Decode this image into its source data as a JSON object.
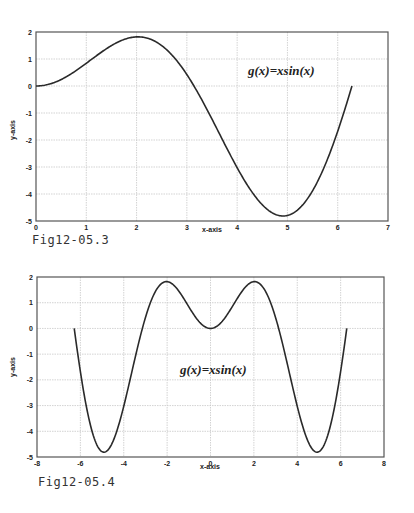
{
  "figures": [
    {
      "caption": "Fig12-05.3"
    },
    {
      "caption": "Fig12-05.4"
    }
  ],
  "chart_data": [
    {
      "type": "line",
      "title": "",
      "annotation": "g(x)=xsin(x)",
      "xlabel": "x-axis",
      "ylabel": "y-axis",
      "xlim": [
        0,
        7
      ],
      "ylim": [
        -5,
        2
      ],
      "xticks": [
        0,
        1,
        2,
        3,
        4,
        5,
        6,
        7
      ],
      "yticks": [
        -5,
        -4,
        -3,
        -2,
        -1,
        0,
        1,
        2
      ],
      "grid": true,
      "function": "x*sin(x)",
      "x_range": [
        0,
        6.2832
      ],
      "series": [
        {
          "name": "g(x)=xsin(x)",
          "x": [
            0,
            0.5,
            1,
            1.5,
            2,
            2.03,
            2.5,
            3,
            3.5,
            4,
            4.5,
            4.91,
            5,
            5.5,
            6,
            6.2832
          ],
          "y": [
            0,
            0.24,
            0.84,
            1.5,
            1.82,
            1.82,
            1.5,
            0.42,
            -1.23,
            -3.03,
            -4.4,
            -4.81,
            -4.79,
            -3.89,
            -1.68,
            0
          ]
        }
      ],
      "caption": "Fig12-05.3"
    },
    {
      "type": "line",
      "title": "",
      "annotation": "g(x)=xsin(x)",
      "xlabel": "x-axis",
      "ylabel": "y-axis",
      "xlim": [
        -8,
        8
      ],
      "ylim": [
        -5,
        2
      ],
      "xticks": [
        -8,
        -6,
        -4,
        -2,
        0,
        2,
        4,
        6,
        8
      ],
      "yticks": [
        -5,
        -4,
        -3,
        -2,
        -1,
        0,
        1,
        2
      ],
      "grid": true,
      "function": "x*sin(x)",
      "x_range": [
        -6.2832,
        6.2832
      ],
      "series": [
        {
          "name": "g(x)=xsin(x)",
          "x": [
            -6.2832,
            -6,
            -5.5,
            -4.91,
            -4.5,
            -4,
            -3.5,
            -3,
            -2.5,
            -2.03,
            -1.5,
            -1,
            -0.5,
            0,
            0.5,
            1,
            1.5,
            2.03,
            2.5,
            3,
            3.5,
            4,
            4.5,
            4.91,
            5.5,
            6,
            6.2832
          ],
          "y": [
            0,
            -1.68,
            -3.89,
            -4.81,
            -4.4,
            -3.03,
            -1.23,
            0.42,
            1.5,
            1.82,
            1.5,
            0.84,
            0.24,
            0,
            0.24,
            0.84,
            1.5,
            1.82,
            1.5,
            0.42,
            -1.23,
            -3.03,
            -4.4,
            -4.81,
            -3.89,
            -1.68,
            0
          ]
        }
      ],
      "caption": "Fig12-05.4"
    }
  ],
  "colors": {
    "curve": "#2a2a2a",
    "grid": "#c8c8c8",
    "axis": "#555555",
    "background": "#ffffff"
  }
}
